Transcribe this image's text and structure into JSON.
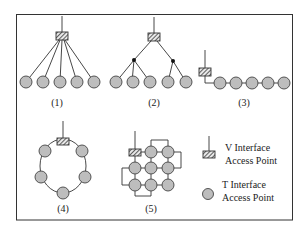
{
  "diagram": {
    "colors": {
      "node_fill": "#bdbdbd",
      "stroke": "#333333",
      "background": "#ffffff"
    },
    "topologies": [
      {
        "id": 1,
        "label": "(1)",
        "type": "star",
        "description": "V access point with 5 T nodes directly connected"
      },
      {
        "id": 2,
        "label": "(2)",
        "type": "tree",
        "description": "V access point branching through 2 junctions to 5 T nodes"
      },
      {
        "id": 3,
        "label": "(3)",
        "type": "bus",
        "description": "V access point with 5 T nodes daisy-chained"
      },
      {
        "id": 4,
        "label": "(4)",
        "type": "ring",
        "description": "V access point on a ring with 5 T nodes"
      },
      {
        "id": 5,
        "label": "(5)",
        "type": "mesh",
        "description": "V access point in a 3x3 grid mesh with 8 T nodes"
      }
    ],
    "legend": {
      "v_interface": {
        "line1": "V Interface",
        "line2": "Access Point",
        "icon": "hatched-box-with-stem"
      },
      "t_interface": {
        "line1": "T Interface",
        "line2": "Access Point",
        "icon": "gray-circle"
      }
    }
  }
}
